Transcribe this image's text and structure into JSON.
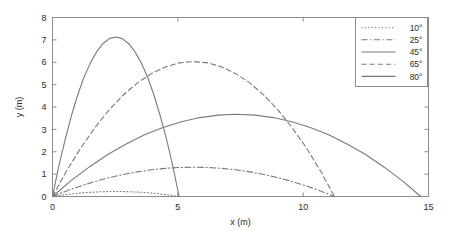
{
  "chart_data": {
    "type": "line",
    "title": "",
    "xlabel": "x (m)",
    "ylabel": "y (m)",
    "xlim": [
      0,
      15
    ],
    "ylim": [
      0,
      8
    ],
    "xticks": [
      "0",
      "5",
      "10",
      "15"
    ],
    "xtick_values": [
      0,
      5,
      10,
      15
    ],
    "yticks": [
      "0",
      "1",
      "2",
      "3",
      "4",
      "5",
      "6",
      "7",
      "8"
    ],
    "ytick_values": [
      0,
      1,
      2,
      3,
      4,
      5,
      6,
      7,
      8
    ],
    "grid": false,
    "legend_position": "top-right",
    "line_color": "#7a7a7a",
    "axis_color": "#8c8c8c",
    "series": [
      {
        "name": "10°",
        "style": "dotted",
        "angle_deg": 10,
        "range_m": 5.05,
        "peak_x": 2.53,
        "peak_y": 0.23,
        "x": [
          0,
          0.25,
          0.51,
          0.76,
          1.01,
          1.26,
          1.52,
          1.77,
          2.02,
          2.27,
          2.53,
          2.78,
          3.03,
          3.28,
          3.54,
          3.79,
          4.04,
          4.29,
          4.55,
          4.8,
          5.05
        ],
        "y": [
          0,
          0.043,
          0.081,
          0.115,
          0.144,
          0.169,
          0.189,
          0.204,
          0.215,
          0.221,
          0.223,
          0.221,
          0.215,
          0.204,
          0.189,
          0.169,
          0.144,
          0.115,
          0.081,
          0.043,
          0
        ]
      },
      {
        "name": "25°",
        "style": "dashdot",
        "angle_deg": 25,
        "range_m": 11.25,
        "peak_x": 5.62,
        "peak_y": 1.31,
        "x": [
          0,
          0.56,
          1.13,
          1.69,
          2.25,
          2.81,
          3.38,
          3.94,
          4.5,
          5.06,
          5.62,
          6.19,
          6.75,
          7.31,
          7.88,
          8.44,
          9.0,
          9.56,
          10.13,
          10.69,
          11.25
        ],
        "y": [
          0,
          0.249,
          0.472,
          0.669,
          0.839,
          0.983,
          1.101,
          1.193,
          1.258,
          1.297,
          1.311,
          1.297,
          1.258,
          1.193,
          1.101,
          0.983,
          0.839,
          0.669,
          0.472,
          0.249,
          0
        ]
      },
      {
        "name": "45°",
        "style": "solid",
        "angle_deg": 45,
        "range_m": 14.69,
        "peak_x": 7.34,
        "peak_y": 3.67,
        "x": [
          0,
          0.73,
          1.47,
          2.2,
          2.94,
          3.67,
          4.41,
          5.14,
          5.88,
          6.61,
          7.34,
          8.08,
          8.81,
          9.55,
          10.28,
          11.02,
          11.75,
          12.49,
          13.22,
          13.96,
          14.69
        ],
        "y": [
          0,
          0.698,
          1.322,
          1.874,
          2.351,
          2.755,
          3.086,
          3.343,
          3.527,
          3.637,
          3.674,
          3.637,
          3.527,
          3.343,
          3.086,
          2.755,
          2.351,
          1.874,
          1.322,
          0.698,
          0
        ]
      },
      {
        "name": "65°",
        "style": "dashed",
        "angle_deg": 65,
        "range_m": 11.25,
        "peak_x": 5.62,
        "peak_y": 6.03,
        "x": [
          0,
          0.56,
          1.13,
          1.69,
          2.25,
          2.81,
          3.38,
          3.94,
          4.5,
          5.06,
          5.62,
          6.19,
          6.75,
          7.31,
          7.88,
          8.44,
          9.0,
          9.56,
          10.13,
          10.69,
          11.25
        ],
        "y": [
          0,
          1.146,
          2.171,
          3.077,
          3.861,
          4.525,
          5.068,
          5.49,
          5.792,
          5.973,
          6.034,
          5.973,
          5.792,
          5.49,
          5.068,
          4.525,
          3.861,
          3.077,
          2.171,
          1.146,
          0
        ]
      },
      {
        "name": "80°",
        "style": "solid",
        "angle_deg": 80,
        "range_m": 5.05,
        "peak_x": 2.53,
        "peak_y": 7.12,
        "x": [
          0,
          0.25,
          0.51,
          0.76,
          1.01,
          1.26,
          1.52,
          1.77,
          2.02,
          2.27,
          2.53,
          2.78,
          3.03,
          3.28,
          3.54,
          3.79,
          4.04,
          4.29,
          4.55,
          4.8,
          5.05
        ],
        "y": [
          0,
          1.353,
          2.563,
          3.632,
          4.558,
          5.342,
          5.983,
          6.483,
          6.84,
          7.055,
          7.127,
          7.055,
          6.84,
          6.483,
          5.983,
          5.342,
          4.558,
          3.632,
          2.563,
          1.353,
          0
        ]
      }
    ]
  }
}
